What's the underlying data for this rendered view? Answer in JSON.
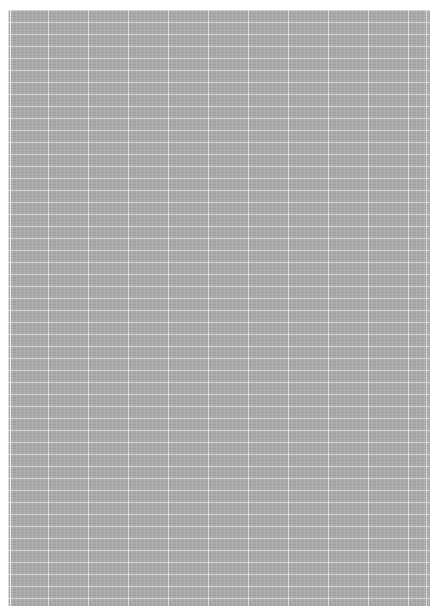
{
  "document": {
    "type": "graph-paper-page",
    "colors": {
      "page_background": "#ffffff",
      "sheet_fill": "#a9a9a9",
      "grid_lines": "#d8d8d8"
    },
    "grid": {
      "major_vertical_spacing_px": 40,
      "horizontal_spacing_px": 12
    },
    "text": []
  }
}
